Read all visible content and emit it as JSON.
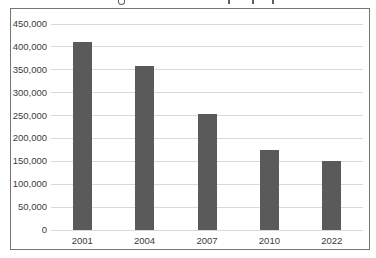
{
  "chart_data": {
    "type": "bar",
    "title": "",
    "title_note": "title cropped out of frame; only descender marks visible",
    "categories": [
      "2001",
      "2004",
      "2007",
      "2010",
      "2022"
    ],
    "values": [
      410000,
      358000,
      253000,
      175000,
      150000
    ],
    "xlabel": "",
    "ylabel": "",
    "ylim": [
      0,
      450000
    ],
    "ytick_step": 50000,
    "ytick_labels": [
      "450,000",
      "400,000",
      "350,000",
      "300,000",
      "250,000",
      "200,000",
      "150,000",
      "100,000",
      "50,000",
      "0"
    ],
    "grid": true,
    "legend": "none",
    "bar_color": "#5a5a5a",
    "gridline_color": "#d9d9d9",
    "frame_border_color": "#757575",
    "label_color": "#3c3c3c",
    "background_color": "#ffffff"
  },
  "layout_marks": {
    "title_descender_positions_px": [
      120,
      228,
      252,
      272
    ]
  }
}
